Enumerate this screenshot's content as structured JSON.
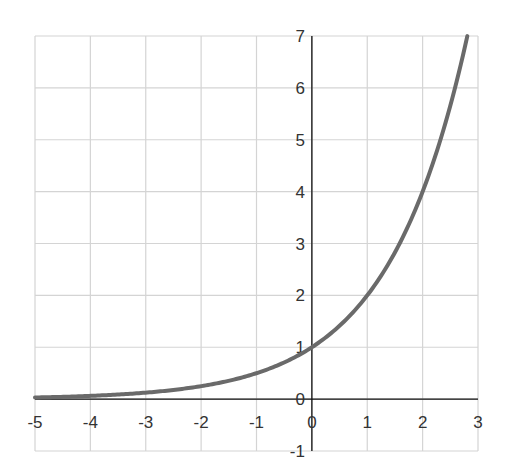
{
  "chart_data": {
    "type": "line",
    "title": "",
    "xlabel": "",
    "ylabel": "",
    "function": "y = 2^x",
    "xlim": [
      -5,
      3
    ],
    "ylim": [
      -1,
      7
    ],
    "grid": true,
    "x_ticks": [
      "-5",
      "-4",
      "-3",
      "-2",
      "-1",
      "0",
      "1",
      "2",
      "3"
    ],
    "y_ticks": [
      "-1",
      "0",
      "1",
      "2",
      "3",
      "4",
      "5",
      "6",
      "7"
    ],
    "series": [
      {
        "name": "y = 2^x",
        "color": "#6a6a6a",
        "x": [
          -5,
          -4,
          -3,
          -2,
          -1,
          0,
          1,
          2,
          2.807
        ],
        "y": [
          0.03125,
          0.0625,
          0.125,
          0.25,
          0.5,
          1,
          2,
          4,
          7
        ]
      }
    ]
  },
  "colors": {
    "grid": "#d4d4d4",
    "axis": "#111111",
    "curve": "#6a6a6a"
  }
}
